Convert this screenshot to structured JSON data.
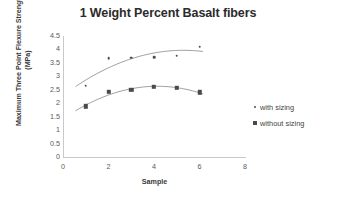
{
  "chart_data": {
    "type": "scatter",
    "title": "1 Weight Percent Basalt fibers",
    "xlabel": "Sample",
    "ylabel": "Maximum Three Point Flexure Strength (MPa)",
    "ylabel_line1": "Maximum Three Point Flexure Strength",
    "ylabel_line2": "(MPa)",
    "xlim": [
      0,
      8
    ],
    "ylim": [
      0,
      4.5
    ],
    "xticks": [
      0,
      2,
      4,
      6,
      8
    ],
    "yticks": [
      0,
      0.5,
      1,
      1.5,
      2,
      2.5,
      3,
      3.5,
      4,
      4.5
    ],
    "xtick_labels": [
      "0",
      "2",
      "4",
      "6",
      "8"
    ],
    "ytick_labels": [
      "0",
      "0.5",
      "1",
      "1.5",
      "2",
      "2.5",
      "3",
      "3.5",
      "4",
      "4.5"
    ],
    "grid": false,
    "legend_position": "right",
    "x": [
      1,
      2,
      3,
      4,
      5,
      6
    ],
    "series": [
      {
        "name": "with sizing",
        "marker": "diamond",
        "color": "#4d4d4d",
        "values": [
          2.65,
          3.67,
          3.7,
          3.72,
          3.76,
          4.1
        ],
        "trendline": true
      },
      {
        "name": "without sizing",
        "marker": "square",
        "color": "#4a4a4a",
        "values": [
          1.88,
          2.42,
          2.49,
          2.6,
          2.58,
          2.4
        ],
        "trendline": true
      }
    ]
  },
  "legend": {
    "items": [
      {
        "label": "with sizing",
        "marker": "diamond"
      },
      {
        "label": "without sizing",
        "marker": "square"
      }
    ]
  },
  "colors": {
    "axis": "#c9c9c9",
    "text": "#3a3a3a",
    "marker": "#4a4a4a",
    "background": "#ffffff"
  }
}
